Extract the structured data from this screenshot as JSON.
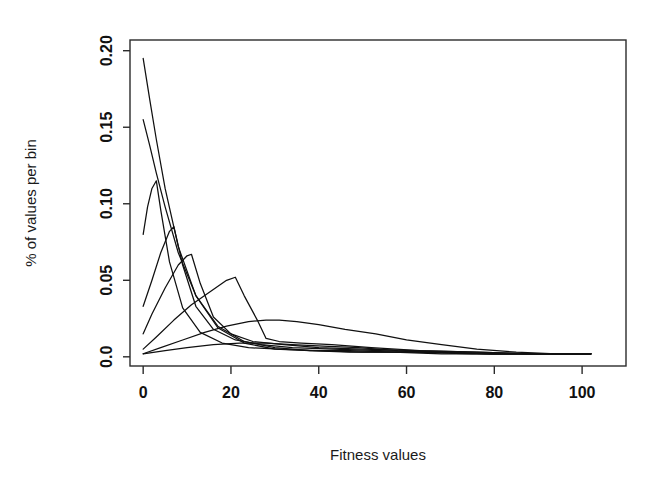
{
  "chart_data": {
    "type": "line",
    "title": "",
    "subtitle": "",
    "xlabel": "Fitness values",
    "ylabel": "% of values per bin",
    "xlim": [
      -3,
      110
    ],
    "ylim": [
      -0.006,
      0.207
    ],
    "xticks": [
      0,
      20,
      40,
      60,
      80,
      100
    ],
    "xtick_labels": [
      "0",
      "20",
      "40",
      "60",
      "80",
      "100"
    ],
    "yticks": [
      0.0,
      0.05,
      0.1,
      0.15,
      0.2
    ],
    "ytick_labels": [
      "0.0",
      "0.05",
      "0.10",
      "0.15",
      "0.20"
    ],
    "grid": false,
    "legend": "none",
    "line_color": "#101010",
    "background_color": "#ffffff",
    "series": [
      {
        "name": "generation-1",
        "x": [
          0,
          1.5,
          3,
          5,
          8,
          12,
          17,
          23,
          30,
          38,
          47,
          57,
          68,
          80,
          92,
          102
        ],
        "values": [
          0.195,
          0.168,
          0.142,
          0.11,
          0.072,
          0.04,
          0.019,
          0.009,
          0.005,
          0.004,
          0.003,
          0.003,
          0.002,
          0.002,
          0.002,
          0.002
        ]
      },
      {
        "name": "generation-2",
        "x": [
          0,
          1.5,
          3,
          5,
          8,
          12,
          17,
          23,
          30,
          38,
          47,
          57,
          68,
          80,
          92,
          102
        ],
        "values": [
          0.155,
          0.138,
          0.12,
          0.098,
          0.068,
          0.04,
          0.02,
          0.01,
          0.006,
          0.004,
          0.004,
          0.003,
          0.003,
          0.002,
          0.002,
          0.002
        ]
      },
      {
        "name": "generation-3",
        "x": [
          0,
          1,
          2,
          3,
          4,
          6,
          9,
          13,
          18,
          24,
          31,
          40,
          50,
          62,
          75,
          88,
          102
        ],
        "values": [
          0.08,
          0.098,
          0.11,
          0.115,
          0.096,
          0.062,
          0.032,
          0.016,
          0.009,
          0.006,
          0.005,
          0.004,
          0.003,
          0.003,
          0.002,
          0.002,
          0.002
        ]
      },
      {
        "name": "generation-4",
        "x": [
          0,
          2,
          4,
          6,
          7,
          9,
          12,
          16,
          21,
          27,
          34,
          43,
          54,
          66,
          80,
          92,
          102
        ],
        "values": [
          0.033,
          0.05,
          0.068,
          0.082,
          0.085,
          0.06,
          0.033,
          0.018,
          0.011,
          0.008,
          0.006,
          0.005,
          0.004,
          0.003,
          0.002,
          0.002,
          0.002
        ]
      },
      {
        "name": "generation-5",
        "x": [
          0,
          2,
          5,
          8,
          10,
          11,
          13,
          16,
          20,
          25,
          32,
          40,
          50,
          62,
          76,
          90,
          102
        ],
        "values": [
          0.015,
          0.028,
          0.045,
          0.06,
          0.066,
          0.067,
          0.048,
          0.026,
          0.015,
          0.01,
          0.008,
          0.006,
          0.005,
          0.004,
          0.003,
          0.002,
          0.002
        ]
      },
      {
        "name": "generation-6",
        "x": [
          0,
          3,
          7,
          11,
          15,
          19,
          21,
          23,
          26,
          28,
          31,
          36,
          43,
          52,
          63,
          76,
          90,
          102
        ],
        "values": [
          0.005,
          0.013,
          0.024,
          0.034,
          0.042,
          0.05,
          0.052,
          0.04,
          0.024,
          0.012,
          0.01,
          0.009,
          0.008,
          0.006,
          0.004,
          0.003,
          0.002,
          0.002
        ]
      },
      {
        "name": "generation-7",
        "x": [
          0,
          4,
          9,
          14,
          19,
          24,
          28,
          31,
          35,
          40,
          46,
          53,
          60,
          68,
          76,
          85,
          94,
          102
        ],
        "values": [
          0.002,
          0.006,
          0.011,
          0.016,
          0.02,
          0.023,
          0.024,
          0.024,
          0.023,
          0.021,
          0.018,
          0.015,
          0.011,
          0.008,
          0.005,
          0.003,
          0.002,
          0.002
        ]
      },
      {
        "name": "baseline-envelope",
        "x": [
          0,
          5,
          10,
          16,
          22,
          28,
          34,
          41,
          49,
          58,
          68,
          79,
          90,
          102
        ],
        "values": [
          0.002,
          0.004,
          0.006,
          0.008,
          0.009,
          0.009,
          0.008,
          0.007,
          0.006,
          0.004,
          0.003,
          0.002,
          0.002,
          0.002
        ]
      }
    ]
  }
}
